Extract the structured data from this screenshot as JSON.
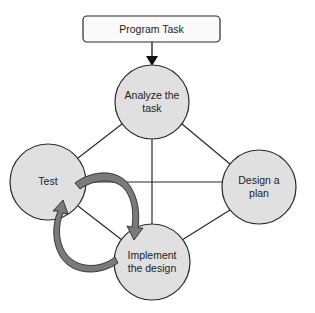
{
  "diagram": {
    "start": {
      "label": "Program Task"
    },
    "nodes": [
      {
        "id": "analyze",
        "lines": [
          "Analyze the",
          "task"
        ]
      },
      {
        "id": "test",
        "lines": [
          "Test"
        ]
      },
      {
        "id": "design",
        "lines": [
          "Design a",
          "plan"
        ]
      },
      {
        "id": "implement",
        "lines": [
          "Implement",
          "the design"
        ]
      }
    ],
    "edges": [
      [
        "program-task",
        "analyze"
      ],
      [
        "analyze",
        "test"
      ],
      [
        "analyze",
        "design"
      ],
      [
        "analyze",
        "implement"
      ],
      [
        "test",
        "design"
      ],
      [
        "test",
        "implement"
      ],
      [
        "design",
        "implement"
      ]
    ],
    "cycle_arrows": [
      {
        "from": "test",
        "to": "implement"
      },
      {
        "from": "implement",
        "to": "test"
      }
    ],
    "colors": {
      "node_fill": "#e0e0e0",
      "stroke": "#2a2a2a",
      "cycle_arrow_fill": "#7a7a7a",
      "box_fill": "#fafafa"
    }
  }
}
